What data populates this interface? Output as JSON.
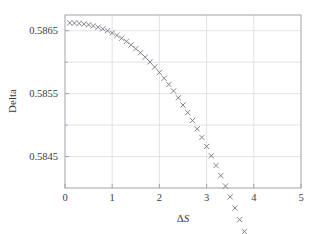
{
  "chart_data": {
    "type": "scatter",
    "title": "",
    "xlabel": "ΔS",
    "ylabel": "Delta",
    "xlim": [
      0,
      5
    ],
    "ylim": [
      0.584,
      0.58675
    ],
    "grid": true,
    "legend": null,
    "marker": "x",
    "marker_color": "#6e6e78",
    "xticks": [
      0,
      1,
      2,
      3,
      4,
      5
    ],
    "xtick_labels": [
      "0",
      "1",
      "2",
      "3",
      "4",
      "5"
    ],
    "yticks": [
      0.5845,
      0.5855,
      0.5865
    ],
    "ytick_labels": [
      "0.5845",
      "0.5855",
      "0.5865"
    ],
    "y_minor_ticks": [
      0.584,
      0.585,
      0.586
    ],
    "x": [
      0.1,
      0.2,
      0.3,
      0.4,
      0.5,
      0.6,
      0.7,
      0.8,
      0.9,
      1.0,
      1.1,
      1.2,
      1.3,
      1.4,
      1.5,
      1.6,
      1.7,
      1.8,
      1.9,
      2.0,
      2.1,
      2.2,
      2.3,
      2.4,
      2.5,
      2.6,
      2.7,
      2.8,
      2.9,
      3.0,
      3.1,
      3.2,
      3.3,
      3.4,
      3.5,
      3.6,
      3.7,
      3.8,
      3.9,
      4.0,
      4.1,
      4.2,
      4.3,
      4.4,
      4.5,
      4.6,
      4.7,
      4.8,
      4.9
    ],
    "y": [
      0.586625,
      0.586622,
      0.586616,
      0.586607,
      0.586594,
      0.586577,
      0.586556,
      0.58653,
      0.5865,
      0.586465,
      0.586425,
      0.58638,
      0.58633,
      0.586275,
      0.586215,
      0.58615,
      0.58608,
      0.586004,
      0.585923,
      0.585836,
      0.585744,
      0.585646,
      0.585543,
      0.585434,
      0.585319,
      0.585199,
      0.585073,
      0.584941,
      0.584804,
      0.584661,
      0.584512,
      0.584357,
      0.584197,
      0.584031,
      0.583859,
      0.583681,
      0.583497,
      0.583308,
      0.583113,
      0.582912,
      0.582705,
      0.582492,
      0.582274,
      0.582049,
      0.581819,
      0.581583,
      0.581341,
      0.581093,
      0.58084
    ],
    "axis_color": "#9a9aa2",
    "grid_color": "#d5d5dd"
  }
}
